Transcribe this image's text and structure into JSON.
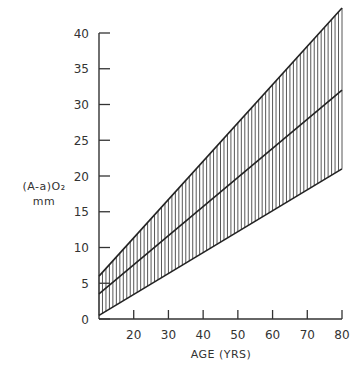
{
  "chart_data": {
    "type": "line",
    "title": "",
    "xlabel": "AGE (YRS)",
    "ylabel_line1": "(A-a)O₂",
    "ylabel_line2": "mm",
    "xlim": [
      10,
      80
    ],
    "ylim": [
      0,
      40
    ],
    "xticks": [
      20,
      30,
      40,
      50,
      60,
      70,
      80
    ],
    "yticks": [
      0,
      5,
      10,
      15,
      20,
      25,
      30,
      35,
      40
    ],
    "grid": false,
    "legend": null,
    "series": [
      {
        "name": "upper bound",
        "x": [
          10,
          80
        ],
        "values": [
          6,
          43.5
        ]
      },
      {
        "name": "mean",
        "x": [
          10,
          80
        ],
        "values": [
          3.5,
          32
        ]
      },
      {
        "name": "lower bound",
        "x": [
          10,
          80
        ],
        "values": [
          0.5,
          21
        ]
      }
    ],
    "shaded_region": {
      "between": [
        "upper bound",
        "lower bound"
      ],
      "pattern": "vertical hatching"
    }
  }
}
